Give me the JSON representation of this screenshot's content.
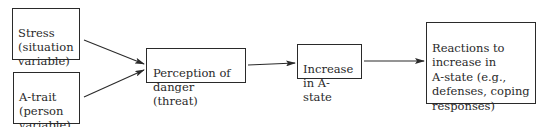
{
  "diagram": {
    "nodes": {
      "stress": {
        "label": "Stress\n(situation\nvariable)"
      },
      "a_trait": {
        "label": "A-trait\n(person\nvariable)"
      },
      "perception": {
        "label": "Perception of\ndanger (threat)"
      },
      "increase": {
        "label": "Increase\nin A-state"
      },
      "reactions": {
        "label": "Reactions to\nincrease in\nA-state (e.g.,\ndefenses, coping\nresponses)"
      }
    },
    "edges": [
      {
        "from": "stress",
        "to": "perception"
      },
      {
        "from": "a_trait",
        "to": "perception"
      },
      {
        "from": "perception",
        "to": "increase"
      },
      {
        "from": "increase",
        "to": "reactions"
      }
    ],
    "colors": {
      "stroke": "#2a2a2a",
      "background": "#ffffff"
    }
  }
}
